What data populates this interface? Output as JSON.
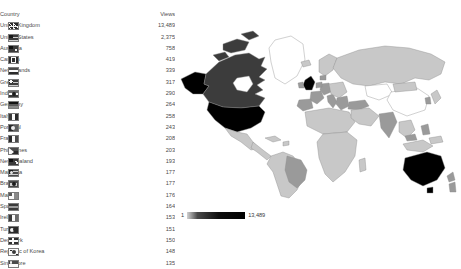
{
  "table": {
    "headers": {
      "country": "Country",
      "views": "Views"
    },
    "rows": [
      {
        "country": "United Kingdom",
        "views": "13,489",
        "flag": "united-kingdom-flag"
      },
      {
        "country": "United States",
        "views": "2,375",
        "flag": "united-states-flag"
      },
      {
        "country": "Australia",
        "views": "758",
        "flag": "australia-flag"
      },
      {
        "country": "Canada",
        "views": "419",
        "flag": "canada-flag"
      },
      {
        "country": "Netherlands",
        "views": "339",
        "flag": "netherlands-flag"
      },
      {
        "country": "Greece",
        "views": "317",
        "flag": "greece-flag"
      },
      {
        "country": "India",
        "views": "290",
        "flag": "india-flag"
      },
      {
        "country": "Germany",
        "views": "264",
        "flag": "germany-flag"
      },
      {
        "country": "Italy",
        "views": "258",
        "flag": "italy-flag"
      },
      {
        "country": "Portugal",
        "views": "243",
        "flag": "portugal-flag"
      },
      {
        "country": "France",
        "views": "208",
        "flag": "france-flag"
      },
      {
        "country": "Philippines",
        "views": "203",
        "flag": "philippines-flag"
      },
      {
        "country": "New Zealand",
        "views": "193",
        "flag": "new-zealand-flag"
      },
      {
        "country": "Malaysia",
        "views": "177",
        "flag": "malaysia-flag"
      },
      {
        "country": "Brazil",
        "views": "177",
        "flag": "brazil-flag"
      },
      {
        "country": "Malta",
        "views": "176",
        "flag": "malta-flag"
      },
      {
        "country": "Spain",
        "views": "164",
        "flag": "spain-flag"
      },
      {
        "country": "Ireland",
        "views": "153",
        "flag": "ireland-flag"
      },
      {
        "country": "Turkey",
        "views": "151",
        "flag": "turkey-flag"
      },
      {
        "country": "Denmark",
        "views": "150",
        "flag": "denmark-flag"
      },
      {
        "country": "Republic of Korea",
        "views": "148",
        "flag": "republic-of-korea-flag"
      },
      {
        "country": "Singapore",
        "views": "135",
        "flag": "singapore-flag"
      }
    ]
  },
  "map": {
    "type": "choropleth",
    "legend": {
      "min": "1",
      "max": "13,489"
    },
    "colors": {
      "no_data": "#ffffff",
      "low": "#c8c8c8",
      "mid": "#9a9a9a",
      "high": "#3c3c3c",
      "max": "#000000",
      "outline": "#8c8c8c"
    },
    "shaded_regions": [
      {
        "name": "United Kingdom",
        "value": 13489,
        "shade": "max"
      },
      {
        "name": "United States",
        "value": 2375,
        "shade": "max"
      },
      {
        "name": "Australia",
        "value": 758,
        "shade": "max"
      },
      {
        "name": "Canada",
        "value": 419,
        "shade": "high"
      },
      {
        "name": "Netherlands",
        "value": 339,
        "shade": "mid"
      },
      {
        "name": "Greece",
        "value": 317,
        "shade": "mid"
      },
      {
        "name": "India",
        "value": 290,
        "shade": "mid"
      },
      {
        "name": "Germany",
        "value": 264,
        "shade": "mid"
      },
      {
        "name": "Italy",
        "value": 258,
        "shade": "mid"
      },
      {
        "name": "Portugal",
        "value": 243,
        "shade": "mid"
      },
      {
        "name": "France",
        "value": 208,
        "shade": "mid"
      },
      {
        "name": "Philippines",
        "value": 203,
        "shade": "mid"
      },
      {
        "name": "New Zealand",
        "value": 193,
        "shade": "mid"
      },
      {
        "name": "Malaysia",
        "value": 177,
        "shade": "mid"
      },
      {
        "name": "Brazil",
        "value": 177,
        "shade": "mid"
      },
      {
        "name": "Spain",
        "value": 164,
        "shade": "mid"
      },
      {
        "name": "Ireland",
        "value": 153,
        "shade": "mid"
      },
      {
        "name": "Turkey",
        "value": 151,
        "shade": "mid"
      },
      {
        "name": "Denmark",
        "value": 150,
        "shade": "mid"
      },
      {
        "name": "Republic of Korea",
        "value": 148,
        "shade": "mid"
      },
      {
        "name": "Singapore",
        "value": 135,
        "shade": "mid"
      },
      {
        "name": "Russia",
        "value": null,
        "shade": "low"
      },
      {
        "name": "Greenland",
        "value": null,
        "shade": "no_data"
      },
      {
        "name": "China",
        "value": null,
        "shade": "no_data"
      }
    ]
  }
}
